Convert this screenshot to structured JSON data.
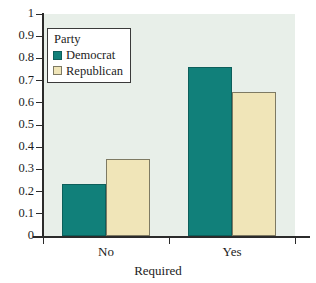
{
  "chart_data": {
    "type": "bar",
    "title": "",
    "xlabel": "Required",
    "ylabel": "",
    "categories": [
      "No",
      "Yes"
    ],
    "series": [
      {
        "name": "Democrat",
        "color": "#11807a",
        "values": [
          0.235,
          0.76
        ]
      },
      {
        "name": "Republican",
        "color": "#f0e5b8",
        "values": [
          0.348,
          0.648
        ]
      }
    ],
    "ylim": [
      0,
      1
    ],
    "yticks": [
      0,
      0.1,
      0.2,
      0.3,
      0.4,
      0.5,
      0.6,
      0.7,
      0.8,
      0.9,
      1
    ],
    "ytick_labels": [
      "0",
      "0.1",
      "0.2",
      "0.3",
      "0.4",
      "0.5",
      "0.6",
      "0.7",
      "0.8",
      "0.9",
      "1"
    ],
    "grid": false,
    "legend": {
      "title": "Party",
      "position": "top-left",
      "entries": [
        {
          "label": "Democrat",
          "color": "#11807a"
        },
        {
          "label": "Republican",
          "color": "#f0e5b8"
        }
      ]
    },
    "plot_background": "#e8efe9",
    "page_background": "#ffffff",
    "axis_color": "#2b2b2b"
  }
}
